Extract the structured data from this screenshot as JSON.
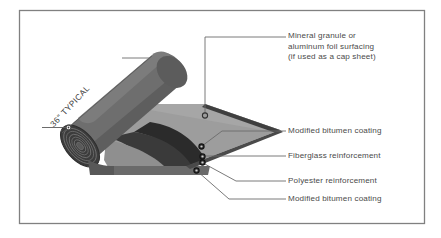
{
  "figure": {
    "border_color": "#808080",
    "background_color": "#ffffff"
  },
  "dimension": {
    "label": "36\" TYPICAL",
    "angle_deg": -47
  },
  "colors": {
    "roll_body": "#6e6e6e",
    "roll_end": "#5a5a5a",
    "sheet_top": "#9a9a9a",
    "sheet_underside": "#2f2f2f",
    "sheet_edge": "#4a4a4a",
    "line": "#6b6b6b",
    "text": "#4a4a4a"
  },
  "callouts": [
    {
      "id": "surfacing",
      "lines": [
        "Mineral granule or",
        "aluminum foil surfacing",
        "(if used as a cap sheet)"
      ]
    },
    {
      "id": "bitumen-top",
      "lines": [
        "Modified bitumen coating"
      ]
    },
    {
      "id": "fiberglass",
      "lines": [
        "Fiberglass reinforcement"
      ]
    },
    {
      "id": "polyester",
      "lines": [
        "Polyester reinforcement"
      ]
    },
    {
      "id": "bitumen-bottom",
      "lines": [
        "Modified bitumen coating"
      ]
    }
  ]
}
